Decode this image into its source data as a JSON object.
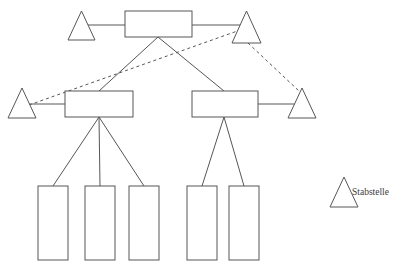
{
  "diagram": {
    "type": "organizational-chart",
    "title": "",
    "canvas": {
      "width": 402,
      "height": 265,
      "background": "#ffffff"
    },
    "style": {
      "stroke_color": "#565656",
      "fill_color": "#ffffff",
      "stroke_width": 1,
      "dashed_pattern": "3 3"
    },
    "nodes": [
      {
        "id": "top-box",
        "shape": "rectangle",
        "label": "",
        "level": "top",
        "x": 125,
        "y": 11,
        "width": 67,
        "height": 26
      },
      {
        "id": "top-left-triangle",
        "shape": "triangle",
        "label": "",
        "level": "top",
        "x": 68,
        "y": 11,
        "width": 27,
        "height": 29
      },
      {
        "id": "top-right-triangle",
        "shape": "triangle",
        "label": "",
        "level": "top",
        "x": 232,
        "y": 11,
        "width": 29,
        "height": 32
      },
      {
        "id": "middle-left-box",
        "shape": "rectangle",
        "label": "",
        "level": "middle",
        "x": 65,
        "y": 91,
        "width": 68,
        "height": 26
      },
      {
        "id": "middle-right-box",
        "shape": "rectangle",
        "label": "",
        "level": "middle",
        "x": 192,
        "y": 91,
        "width": 66,
        "height": 26
      },
      {
        "id": "middle-left-triangle",
        "shape": "triangle",
        "label": "",
        "level": "middle",
        "x": 8,
        "y": 88,
        "width": 28,
        "height": 30
      },
      {
        "id": "middle-right-triangle",
        "shape": "triangle",
        "label": "",
        "level": "middle",
        "x": 288,
        "y": 88,
        "width": 28,
        "height": 30
      },
      {
        "id": "bottom-box-1",
        "shape": "rectangle",
        "label": "",
        "level": "bottom",
        "x": 38,
        "y": 186,
        "width": 30,
        "height": 74
      },
      {
        "id": "bottom-box-2",
        "shape": "rectangle",
        "label": "",
        "level": "bottom",
        "x": 85,
        "y": 186,
        "width": 30,
        "height": 74
      },
      {
        "id": "bottom-box-3",
        "shape": "rectangle",
        "label": "",
        "level": "bottom",
        "x": 129,
        "y": 186,
        "width": 30,
        "height": 74
      },
      {
        "id": "bottom-box-4",
        "shape": "rectangle",
        "label": "",
        "level": "bottom",
        "x": 187,
        "y": 186,
        "width": 30,
        "height": 74
      },
      {
        "id": "bottom-box-5",
        "shape": "rectangle",
        "label": "",
        "level": "bottom",
        "x": 229,
        "y": 186,
        "width": 30,
        "height": 74
      }
    ],
    "connectors": [
      {
        "id": "c-topleft-tri-to-top-box",
        "style": "solid",
        "from": "top-left-triangle",
        "to": "top-box",
        "x1": 82,
        "y1": 25,
        "x2": 125,
        "y2": 25
      },
      {
        "id": "c-top-box-to-topright-tri",
        "style": "solid",
        "from": "top-box",
        "to": "top-right-triangle",
        "x1": 192,
        "y1": 25,
        "x2": 246,
        "y2": 25
      },
      {
        "id": "c-top-box-to-middle-left",
        "style": "solid",
        "from": "top-box",
        "to": "middle-left-box",
        "x1": 158,
        "y1": 37,
        "x2": 99,
        "y2": 91
      },
      {
        "id": "c-top-box-to-middle-right",
        "style": "solid",
        "from": "top-box",
        "to": "middle-right-box",
        "x1": 158,
        "y1": 37,
        "x2": 224,
        "y2": 91
      },
      {
        "id": "c-middle-left-to-left-tri",
        "style": "solid",
        "from": "middle-left-box",
        "to": "middle-left-triangle",
        "x1": 65,
        "y1": 104,
        "x2": 28,
        "y2": 104
      },
      {
        "id": "c-middle-right-to-right-tri",
        "style": "solid",
        "from": "middle-right-box",
        "to": "middle-right-triangle",
        "x1": 258,
        "y1": 104,
        "x2": 296,
        "y2": 104
      },
      {
        "id": "c-staff-left-dashed",
        "style": "dashed",
        "from": "middle-left-triangle",
        "to": "top-right-triangle",
        "x1": 29,
        "y1": 105,
        "x2": 243,
        "y2": 29
      },
      {
        "id": "c-staff-right-dashed",
        "style": "dashed",
        "from": "top-right-triangle",
        "to": "middle-right-triangle",
        "x1": 248,
        "y1": 43,
        "x2": 299,
        "y2": 91
      },
      {
        "id": "c-middle-left-to-bottom-1",
        "style": "solid",
        "from": "middle-left-box",
        "to": "bottom-box-1",
        "x1": 99,
        "y1": 117,
        "x2": 53,
        "y2": 186
      },
      {
        "id": "c-middle-left-to-bottom-2",
        "style": "solid",
        "from": "middle-left-box",
        "to": "bottom-box-2",
        "x1": 99,
        "y1": 117,
        "x2": 100,
        "y2": 186
      },
      {
        "id": "c-middle-left-to-bottom-3",
        "style": "solid",
        "from": "middle-left-box",
        "to": "bottom-box-3",
        "x1": 99,
        "y1": 117,
        "x2": 144,
        "y2": 186
      },
      {
        "id": "c-middle-right-to-bottom-4",
        "style": "solid",
        "from": "middle-right-box",
        "to": "bottom-box-4",
        "x1": 224,
        "y1": 117,
        "x2": 202,
        "y2": 186
      },
      {
        "id": "c-middle-right-to-bottom-5",
        "style": "solid",
        "from": "middle-right-box",
        "to": "bottom-box-5",
        "x1": 224,
        "y1": 117,
        "x2": 244,
        "y2": 186
      }
    ],
    "legend": {
      "symbol": "triangle",
      "label": "Stabstelle",
      "symbol_x": 330,
      "symbol_y": 177,
      "symbol_width": 28,
      "symbol_height": 30,
      "label_x": 352,
      "label_y": 194
    }
  }
}
